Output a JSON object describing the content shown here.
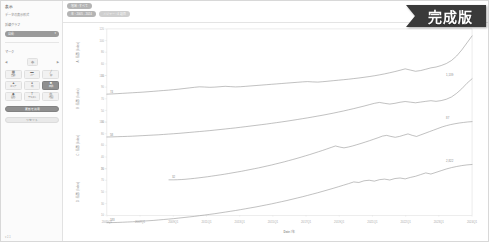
{
  "sidebar": {
    "title": "表示",
    "subtitle": "データの表示形式",
    "measure_label": "折線グラフ",
    "measure_value": "自動",
    "marks_label": "マーク",
    "icons_header": "マークタイプ",
    "grid_buttons": [
      {
        "icon": "▦",
        "label": "自動",
        "name": "mark-auto",
        "active": false
      },
      {
        "icon": "▬",
        "label": "バー",
        "name": "mark-bar",
        "active": false
      },
      {
        "icon": "╱",
        "label": "線",
        "name": "mark-line",
        "active": false
      },
      {
        "icon": "▲",
        "label": "エリア",
        "name": "mark-area",
        "active": false
      },
      {
        "icon": "●",
        "label": "円",
        "name": "mark-circle",
        "active": false
      },
      {
        "icon": "■",
        "label": "四角",
        "name": "mark-square",
        "active": true
      },
      {
        "icon": "◆",
        "label": "図形",
        "name": "mark-shape",
        "active": false
      },
      {
        "icon": "T",
        "label": "テキスト",
        "name": "mark-text",
        "active": false
      },
      {
        "icon": "◎",
        "label": "地図",
        "name": "mark-map",
        "active": false
      }
    ],
    "stepper_label": "サイズ",
    "stepper_value": "中",
    "stepper_prev": "◀",
    "stepper_next": "▶",
    "apply_label": "更新を適用",
    "reset_label": "リセット",
    "footer": "v 2.1"
  },
  "topbar": {
    "chips": [
      {
        "label": "地域 : すべて",
        "style": "dark",
        "name": "filter-chip-region"
      },
      {
        "label": "年 : 2005 - 2024",
        "style": "dark",
        "name": "filter-chip-year"
      },
      {
        "label": "メジャー : 4 項目",
        "style": "light",
        "name": "filter-chip-measure"
      }
    ]
  },
  "badge": {
    "text": "完成版",
    "fill": "#3a3a3a"
  },
  "chart_data": {
    "type": "line",
    "title": "",
    "xlabel": "Date / 年",
    "ylabel": "",
    "grid": false,
    "legend_position": "none",
    "xticks": [
      "2005Q1",
      "2007Q1",
      "2009Q1",
      "2011Q1",
      "2013Q1",
      "2015Q1",
      "2017Q1",
      "2019Q1",
      "2021Q1",
      "2022Q1",
      "2023Q1",
      "2024Q1"
    ],
    "axes": [
      {
        "name": "Value A",
        "title": "A : 指数 (Index)",
        "ylim": [
          40,
          120
        ],
        "ticks": [
          40,
          60,
          80,
          100,
          120
        ]
      },
      {
        "name": "Value B",
        "title": "B : 指数 (Index)",
        "ylim": [
          30,
          110
        ],
        "ticks": [
          30,
          50,
          70,
          90,
          110
        ]
      },
      {
        "name": "Value C",
        "title": "C : 指数 (Index)",
        "ylim": [
          20,
          100
        ],
        "ticks": [
          20,
          40,
          60,
          80,
          100
        ]
      },
      {
        "name": "Value D",
        "title": "D : 指数 (Index)",
        "ylim": [
          10,
          90
        ],
        "ticks": [
          10,
          30,
          50,
          70,
          90
        ]
      }
    ],
    "series": [
      {
        "name": "Series A",
        "color": "#8c8c8c",
        "start_label": "74",
        "end_label": "",
        "values": [
          74,
          74.2,
          74.5,
          74.8,
          75.1,
          75.4,
          75.7,
          76.0,
          76.4,
          76.8,
          77.2,
          77.6,
          78.0,
          78.5,
          79.0,
          79.6,
          80.2,
          80.8,
          81.3,
          81.1,
          80.8,
          81.0,
          81.4,
          81.8,
          81.5,
          81.2,
          81.4,
          81.8,
          82.2,
          82.6,
          83.0,
          83.4,
          83.8,
          84.2,
          84.6,
          85.0,
          85.4,
          85.8,
          86.2,
          86.5,
          86.2,
          86.0,
          86.4,
          86.9,
          87.4,
          87.9,
          88.4,
          88.9,
          89.5,
          90.1,
          90.8,
          91.5,
          92.3,
          93.2,
          94.2,
          95.3,
          96.5,
          97.8,
          99.2,
          98.0,
          96.8,
          97.5,
          98.8,
          100.2,
          101.0,
          102.5,
          104.5,
          107.5,
          112.0,
          118.0,
          125.0,
          132.0
        ]
      },
      {
        "name": "Series B",
        "color": "#8c8c8c",
        "start_label": "58",
        "end_label": "1,139",
        "values": [
          58,
          58.1,
          58.3,
          58.5,
          58.7,
          58.9,
          59.2,
          59.5,
          59.8,
          60.1,
          60.4,
          60.8,
          61.2,
          61.6,
          62.0,
          62.5,
          63.0,
          63.5,
          64.0,
          64.5,
          65.0,
          65.6,
          66.2,
          66.8,
          67.4,
          68.0,
          68.7,
          69.4,
          70.1,
          70.8,
          71.5,
          72.2,
          73.0,
          73.8,
          74.6,
          75.4,
          76.3,
          77.2,
          78.1,
          79.0,
          80.0,
          81.0,
          82.0,
          83.1,
          84.2,
          85.4,
          86.6,
          87.9,
          89.2,
          90.6,
          92.0,
          93.5,
          95.0,
          96.0,
          95.0,
          94.2,
          95.0,
          96.2,
          97.0,
          96.3,
          95.6,
          96.4,
          97.2,
          97.9,
          97.2,
          98.0,
          99.5,
          102.0,
          106.0,
          111.0,
          117.0,
          122.0
        ]
      },
      {
        "name": "Series C",
        "color": "#8c8c8c",
        "start_label": "32",
        "end_label": "87",
        "values": [
          32,
          32.0,
          32.1,
          32.3,
          32.6,
          33.0,
          33.4,
          33.9,
          34.4,
          34.9,
          35.5,
          36.1,
          36.7,
          37.3,
          38.0,
          38.7,
          39.4,
          40.1,
          40.9,
          41.7,
          42.5,
          43.3,
          44.2,
          45.1,
          46.0,
          47.0,
          48.0,
          49.0,
          50.1,
          51.2,
          52.3,
          53.5,
          54.7,
          55.9,
          57.2,
          58.5,
          59.8,
          61.2,
          62.6,
          64.0,
          63.0,
          62.2,
          63.0,
          64.0,
          65.2,
          66.4,
          67.7,
          69.0,
          70.4,
          71.8,
          73.3,
          74.0,
          73.0,
          72.2,
          73.0,
          74.2,
          75.4,
          74.0,
          73.0,
          74.5,
          76.0,
          77.5,
          79.0,
          80.5,
          82.0,
          83.2,
          84.2,
          85.0,
          85.7,
          86.2,
          86.7,
          87.0
        ]
      },
      {
        "name": "Series D",
        "color": "#8c8c8c",
        "start_label": "183",
        "end_label": "2,822",
        "values": [
          18.3,
          18.4,
          18.5,
          18.7,
          18.9,
          19.1,
          19.4,
          19.7,
          20.0,
          20.3,
          20.7,
          21.1,
          21.5,
          21.9,
          22.4,
          22.9,
          23.4,
          23.9,
          24.5,
          25.1,
          25.7,
          26.3,
          27.0,
          27.7,
          28.4,
          29.1,
          29.9,
          30.7,
          31.5,
          32.3,
          33.2,
          34.1,
          35.0,
          36.0,
          37.0,
          38.0,
          39.1,
          40.2,
          41.3,
          42.5,
          43.7,
          44.9,
          46.2,
          47.5,
          48.8,
          50.2,
          51.6,
          53.0,
          54.5,
          54.0,
          55.5,
          56.0,
          55.2,
          56.5,
          57.0,
          56.2,
          57.5,
          58.0,
          57.2,
          58.5,
          59.5,
          61.0,
          62.5,
          61.5,
          63.0,
          64.5,
          66.0,
          67.2,
          68.2,
          69.0,
          69.6,
          70.0
        ]
      }
    ]
  }
}
